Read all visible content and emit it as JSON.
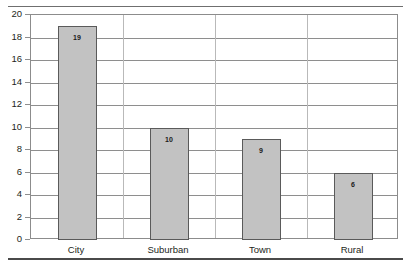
{
  "chart_data": {
    "type": "bar",
    "title": "",
    "xlabel": "",
    "ylabel": "",
    "categories": [
      "City",
      "Suburban",
      "Town",
      "Rural"
    ],
    "values": [
      19,
      10,
      9,
      6
    ],
    "value_labels": [
      "19",
      "10",
      "9",
      "6"
    ],
    "ylim": [
      0,
      20
    ],
    "ytick_labels": [
      "0",
      "2",
      "4",
      "6",
      "8",
      "10",
      "12",
      "14",
      "16",
      "18",
      "20"
    ],
    "ytick_values": [
      0,
      2,
      4,
      6,
      8,
      10,
      12,
      14,
      16,
      18,
      20
    ],
    "grid": "horizontal-and-category-separators",
    "legend": "none",
    "bar_color": "#c2c2c2",
    "bar_border_color": "#5a5a5a",
    "gridline_color": "#8e8e8e",
    "axis_color": "#8c8c8c",
    "text_color": "#231f20"
  },
  "figure": {
    "title_clipped": "",
    "top_rule": "",
    "bottom_rule": ""
  }
}
